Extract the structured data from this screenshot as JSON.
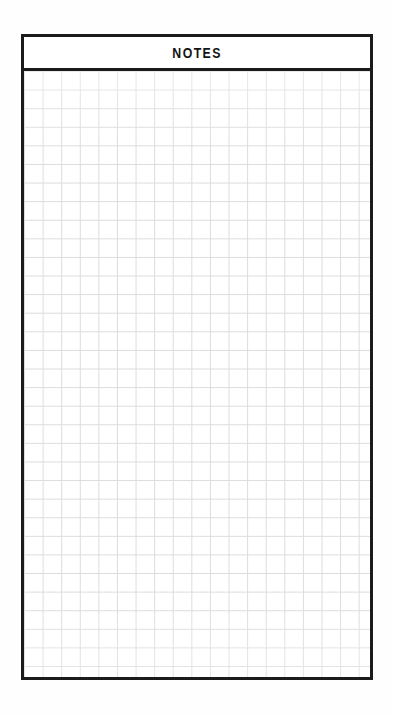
{
  "page": {
    "background_color": "#fefefe",
    "width": 393,
    "height": 714
  },
  "notes_panel": {
    "border_color": "#1b1b1b",
    "background_color": "#ffffff",
    "header": {
      "title": "NOTES"
    },
    "grid": {
      "line_color": "#dcdcdc",
      "cell_size_px": 18.6,
      "columns": 19,
      "rows": 33,
      "content": ""
    }
  }
}
